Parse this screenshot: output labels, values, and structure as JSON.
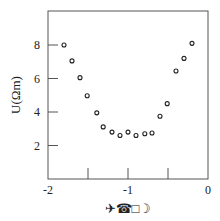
{
  "chart_data": {
    "type": "scatter",
    "title": "",
    "xlabel": "✈☎□☽",
    "ylabel": "U(Ωm)",
    "xlim": [
      -2,
      0
    ],
    "ylim": [
      0,
      9.8
    ],
    "xticks": [
      -2,
      -1,
      0
    ],
    "xtick_labels": [
      "-2",
      "-1",
      "0"
    ],
    "xminor_ticks": [
      -1.5,
      -0.5
    ],
    "yticks": [
      2,
      4,
      6,
      8
    ],
    "ytick_labels": [
      "2",
      "4",
      "6",
      "8"
    ],
    "grid": false,
    "legend": null,
    "marker": "open-circle",
    "series": [
      {
        "name": "U",
        "x": [
          -1.8,
          -1.7,
          -1.6,
          -1.51,
          -1.39,
          -1.31,
          -1.2,
          -1.1,
          -1.0,
          -0.9,
          -0.79,
          -0.7,
          -0.6,
          -0.51,
          -0.4,
          -0.3,
          -0.2
        ],
        "y": [
          8.0,
          7.05,
          6.05,
          4.97,
          3.95,
          3.11,
          2.8,
          2.6,
          2.8,
          2.6,
          2.7,
          2.75,
          3.75,
          4.5,
          6.45,
          7.2,
          8.1
        ]
      }
    ]
  },
  "colors": {
    "axis": "#444444",
    "marker": "#222222",
    "background": "#ffffff"
  }
}
